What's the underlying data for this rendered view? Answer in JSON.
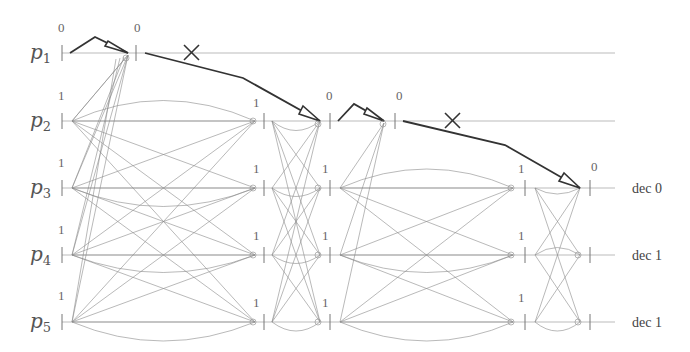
{
  "diagram": {
    "type": "distributed-protocol-execution",
    "processes": [
      {
        "id": "p1",
        "base": "p",
        "sub": "1",
        "y": 53,
        "line_end": 615,
        "decision": null
      },
      {
        "id": "p2",
        "base": "p",
        "sub": "2",
        "y": 121,
        "line_end": 615,
        "decision": null
      },
      {
        "id": "p3",
        "base": "p",
        "sub": "3",
        "y": 188,
        "line_end": 615,
        "decision": "dec 0"
      },
      {
        "id": "p4",
        "base": "p",
        "sub": "4",
        "y": 255,
        "line_end": 615,
        "decision": "dec 1"
      },
      {
        "id": "p5",
        "base": "p",
        "sub": "5",
        "y": 322,
        "line_end": 615,
        "decision": "dec 1"
      }
    ],
    "round_labels": [
      {
        "process": "p1",
        "x": 65,
        "value": "0"
      },
      {
        "process": "p1",
        "x": 138,
        "value": "0"
      },
      {
        "process": "p2",
        "x": 65,
        "value": "1"
      },
      {
        "process": "p2",
        "x": 257,
        "value": "1"
      },
      {
        "process": "p2",
        "x": 328,
        "value": "0"
      },
      {
        "process": "p2",
        "x": 398,
        "value": "0"
      },
      {
        "process": "p3",
        "x": 65,
        "value": "1"
      },
      {
        "process": "p3",
        "x": 257,
        "value": "1"
      },
      {
        "process": "p3",
        "x": 326,
        "value": "1"
      },
      {
        "process": "p3",
        "x": 522,
        "value": "1"
      },
      {
        "process": "p3",
        "x": 594,
        "value": "0"
      },
      {
        "process": "p4",
        "x": 65,
        "value": "1"
      },
      {
        "process": "p4",
        "x": 257,
        "value": "1"
      },
      {
        "process": "p4",
        "x": 326,
        "value": "1"
      },
      {
        "process": "p4",
        "x": 522,
        "value": "1"
      },
      {
        "process": "p5",
        "x": 65,
        "value": "1"
      },
      {
        "process": "p5",
        "x": 257,
        "value": "1"
      },
      {
        "process": "p5",
        "x": 326,
        "value": "1"
      },
      {
        "process": "p5",
        "x": 522,
        "value": "1"
      }
    ],
    "crashed_message_marks": [
      {
        "x": 191,
        "y": 53,
        "symbol": "X"
      },
      {
        "x": 452,
        "y": 121,
        "symbol": "X"
      }
    ]
  }
}
